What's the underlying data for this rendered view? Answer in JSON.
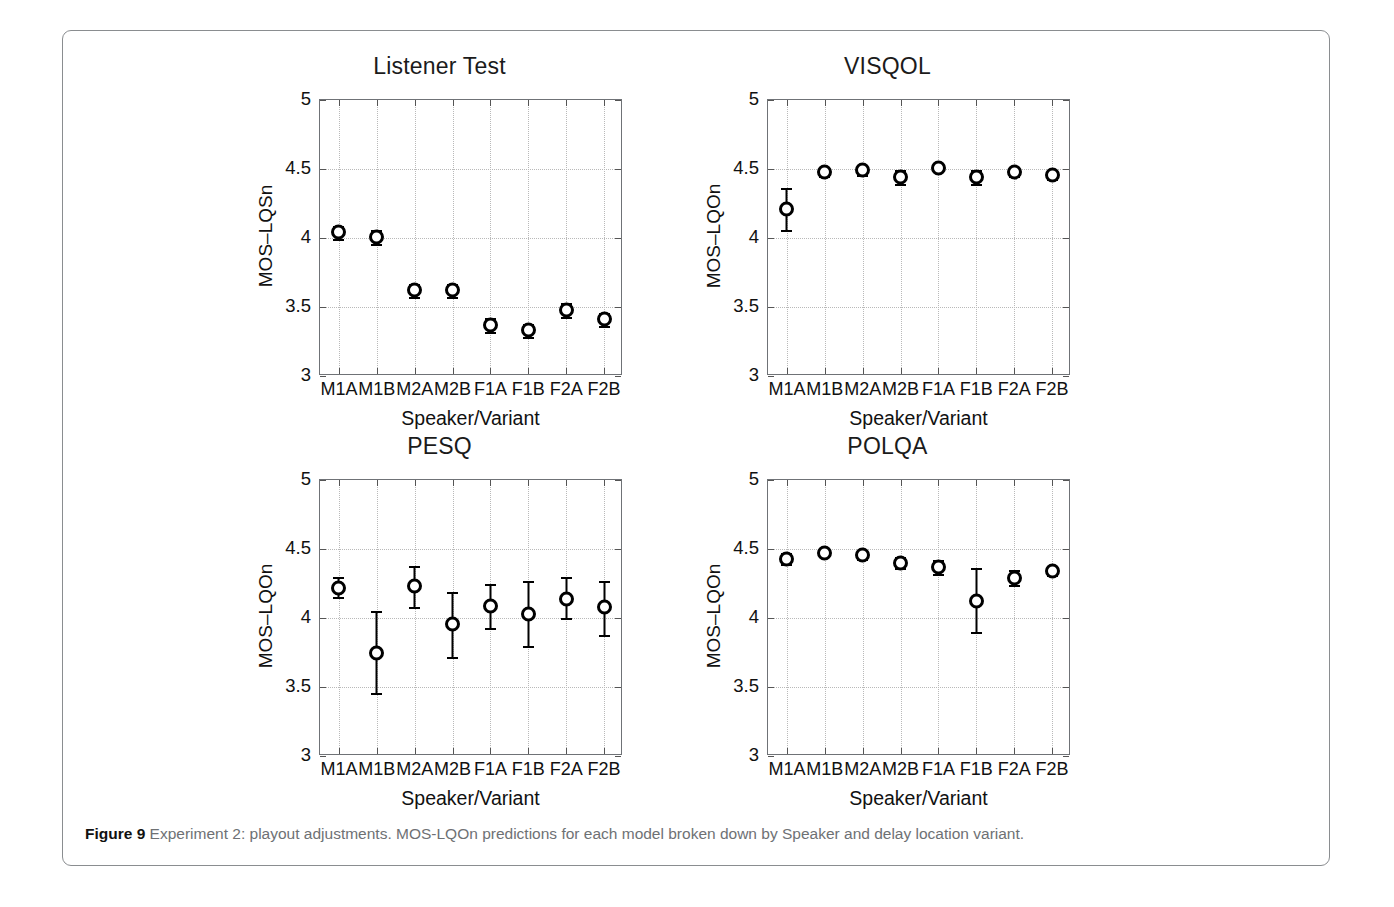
{
  "figure": {
    "caption_label": "Figure 9",
    "caption_text": "Experiment 2: playout adjustments. MOS-LQOn predictions for each model broken down by Speaker and delay location variant.",
    "border_color": "#8a8d90",
    "marker_color": "#000000",
    "grid_color": "#b9b9b9"
  },
  "chart_data": [
    {
      "type": "scatter",
      "title": "Listener Test",
      "xlabel": "Speaker/Variant",
      "ylabel": "MOS–LQSn",
      "ylim": [
        3,
        5
      ],
      "yticks": [
        "3",
        "3.5",
        "4",
        "4.5",
        "5"
      ],
      "ytick_values": [
        3,
        3.5,
        4,
        4.5,
        5
      ],
      "grid": true,
      "legend": "none",
      "categories": [
        "M1A",
        "M1B",
        "M2A",
        "M2B",
        "F1A",
        "F1B",
        "F2A",
        "F2B"
      ],
      "values": [
        4.04,
        4.01,
        3.62,
        3.62,
        3.37,
        3.33,
        3.48,
        3.41
      ],
      "err_low": [
        3.99,
        3.96,
        3.57,
        3.57,
        3.32,
        3.28,
        3.43,
        3.36
      ],
      "err_high": [
        4.09,
        4.06,
        3.67,
        3.67,
        3.42,
        3.38,
        3.53,
        3.46
      ]
    },
    {
      "type": "scatter",
      "title": "VISQOL",
      "xlabel": "Speaker/Variant",
      "ylabel": "MOS–LQOn",
      "ylim": [
        3,
        5
      ],
      "yticks": [
        "3",
        "3.5",
        "4",
        "4.5",
        "5"
      ],
      "ytick_values": [
        3,
        3.5,
        4,
        4.5,
        5
      ],
      "grid": true,
      "legend": "none",
      "categories": [
        "M1A",
        "M1B",
        "M2A",
        "M2B",
        "F1A",
        "F1B",
        "F2A",
        "F2B"
      ],
      "values": [
        4.21,
        4.48,
        4.49,
        4.44,
        4.51,
        4.44,
        4.48,
        4.46
      ],
      "err_low": [
        4.06,
        4.45,
        4.46,
        4.39,
        4.49,
        4.39,
        4.45,
        4.43
      ],
      "err_high": [
        4.36,
        4.51,
        4.52,
        4.49,
        4.53,
        4.49,
        4.51,
        4.49
      ]
    },
    {
      "type": "scatter",
      "title": "PESQ",
      "xlabel": "Speaker/Variant",
      "ylabel": "MOS–LQOn",
      "ylim": [
        3,
        5
      ],
      "yticks": [
        "3",
        "3.5",
        "4",
        "4.5",
        "5"
      ],
      "ytick_values": [
        3,
        3.5,
        4,
        4.5,
        5
      ],
      "grid": true,
      "legend": "none",
      "categories": [
        "M1A",
        "M1B",
        "M2A",
        "M2B",
        "F1A",
        "F1B",
        "F2A",
        "F2B"
      ],
      "values": [
        4.22,
        3.75,
        4.23,
        3.96,
        4.09,
        4.03,
        4.14,
        4.08
      ],
      "err_low": [
        4.15,
        3.46,
        4.08,
        3.72,
        3.93,
        3.8,
        4.0,
        3.88
      ],
      "err_high": [
        4.3,
        4.05,
        4.38,
        4.19,
        4.25,
        4.27,
        4.3,
        4.27
      ]
    },
    {
      "type": "scatter",
      "title": "POLQA",
      "xlabel": "Speaker/Variant",
      "ylabel": "MOS–LQOn",
      "ylim": [
        3,
        5
      ],
      "yticks": [
        "3",
        "3.5",
        "4",
        "4.5",
        "5"
      ],
      "ytick_values": [
        3,
        3.5,
        4,
        4.5,
        5
      ],
      "grid": true,
      "legend": "none",
      "categories": [
        "M1A",
        "M1B",
        "M2A",
        "M2B",
        "F1A",
        "F1B",
        "F2A",
        "F2B"
      ],
      "values": [
        4.43,
        4.47,
        4.46,
        4.4,
        4.37,
        4.12,
        4.29,
        4.34
      ],
      "err_low": [
        4.39,
        4.45,
        4.43,
        4.36,
        4.32,
        3.9,
        4.24,
        4.31
      ],
      "err_high": [
        4.47,
        4.49,
        4.49,
        4.44,
        4.42,
        4.36,
        4.35,
        4.37
      ]
    }
  ]
}
